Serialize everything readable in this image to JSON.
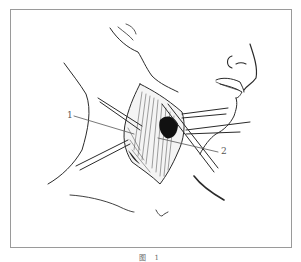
{
  "figure": {
    "caption": "图 1",
    "labels": [
      {
        "id": "1",
        "text": "1"
      },
      {
        "id": "2",
        "text": "2"
      }
    ],
    "colors": {
      "line": "#2a2a2a",
      "frame": "#9a9a9a",
      "label": "#555555",
      "shadow": "#111111"
    }
  }
}
